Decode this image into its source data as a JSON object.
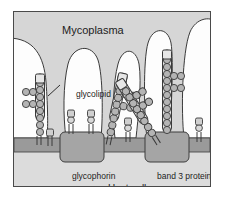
{
  "figure": {
    "domain_type": "biology-diagram",
    "title_label": "Mycoplasma",
    "labels": {
      "mycoplasma": "Mycoplasma",
      "glycolipid": "glycolipid",
      "glycophorin": "glycophorin",
      "band3": "band 3 protein",
      "host_cell": "Host cell"
    },
    "colors": {
      "background": "#d6d6d6",
      "frame_border": "#4a4a4a",
      "mycoplasma_fill": "#fdfdfd",
      "mycoplasma_stroke": "#3a3a3a",
      "membrane_fill": "#9a9a9a",
      "membrane_stroke": "#4a4a4a",
      "cytoplasm_fill": "#dcdcdc",
      "protein_fill": "#a5a5a5",
      "protein_stroke": "#3d3d3d",
      "sugar_fill": "#b4b4b4",
      "sugar_stroke": "#3a3a3a",
      "receptor_fill": "#cfcfcf",
      "receptor_stroke": "#3a3a3a",
      "text": "#1c1c1c"
    },
    "membrane": {
      "top_y": 137,
      "bottom_y": 151,
      "label_left": "glycophorin",
      "label_right": "band 3 protein"
    },
    "mycoplasma_cells": [
      {
        "name": "lobe-left-edge",
        "description": "white lobe at left frame edge"
      },
      {
        "name": "lobe-second",
        "description": "white lobe left of centre"
      },
      {
        "name": "lobe-centre",
        "description": "white lobe centre"
      },
      {
        "name": "lobe-tall-right",
        "description": "tall narrow white lobe right of centre"
      },
      {
        "name": "lobe-right-edge",
        "description": "white lobe at right frame edge"
      }
    ],
    "glycolipid_chains": [
      {
        "name": "glycolipid-chain-1",
        "orientation": "vertical",
        "branches": 2,
        "anchor": "membrane"
      },
      {
        "name": "glycolipid-chain-2",
        "orientation": "tilted",
        "branches": 2,
        "anchor": "membrane"
      },
      {
        "name": "glycolipid-chain-3",
        "orientation": "tilted",
        "branches": 2,
        "anchor": "membrane"
      },
      {
        "name": "glycolipid-chain-4",
        "orientation": "vertical",
        "branches": 2,
        "anchor": "band-3-protein"
      }
    ],
    "membrane_proteins": [
      {
        "name": "glycophorin",
        "type": "large-block",
        "label": "glycophorin"
      },
      {
        "name": "band-3-protein",
        "type": "large-block",
        "label": "band 3 protein"
      },
      {
        "name": "small-glycoprotein-1",
        "type": "small-stalk"
      },
      {
        "name": "small-glycoprotein-2",
        "type": "small-stalk"
      },
      {
        "name": "small-glycoprotein-3",
        "type": "small-stalk"
      },
      {
        "name": "small-glycoprotein-4",
        "type": "small-stalk"
      },
      {
        "name": "small-glycoprotein-5",
        "type": "small-stalk"
      }
    ]
  }
}
